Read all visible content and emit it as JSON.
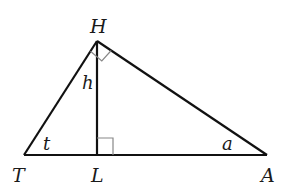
{
  "diagram": {
    "type": "right-triangle-with-altitude",
    "colors": {
      "stroke": "#111111",
      "marker": "#888888",
      "text": "#1a1a1a",
      "background": "#ffffff"
    },
    "vertices": {
      "H": {
        "label": "H",
        "x": 97,
        "y": 41
      },
      "T": {
        "label": "T",
        "x": 24,
        "y": 155
      },
      "L": {
        "label": "L",
        "x": 97,
        "y": 155
      },
      "A": {
        "label": "A",
        "x": 267,
        "y": 155
      }
    },
    "segment_labels": {
      "altitude": "h"
    },
    "angle_labels": {
      "at_T": "t",
      "at_A": "a"
    },
    "right_angles": [
      "H",
      "L"
    ]
  }
}
